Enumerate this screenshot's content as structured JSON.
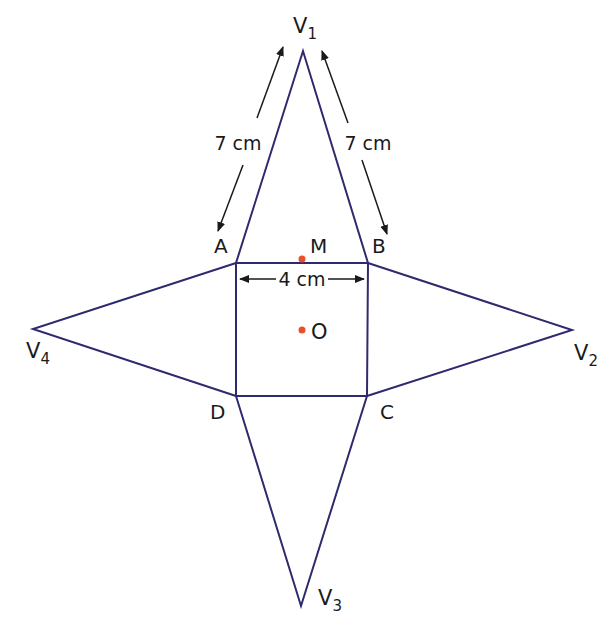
{
  "figure": {
    "type": "net of square-based pyramid",
    "colors": {
      "edge": "#2e2a6e",
      "arrow": "#1a1a1a",
      "point": "#e8502a",
      "text": "#1a1a1a"
    },
    "vertices": {
      "A": {
        "label": "A",
        "x": 236,
        "y": 263
      },
      "B": {
        "label": "B",
        "x": 368,
        "y": 263
      },
      "C": {
        "label": "C",
        "x": 367,
        "y": 396
      },
      "D": {
        "label": "D",
        "x": 236,
        "y": 396
      },
      "V1": {
        "label": "V",
        "sub": "1",
        "x": 303,
        "y": 51
      },
      "V2": {
        "label": "V",
        "sub": "2",
        "x": 572,
        "y": 330
      },
      "V3": {
        "label": "V",
        "sub": "3",
        "x": 301,
        "y": 606
      },
      "V4": {
        "label": "V",
        "sub": "4",
        "x": 33,
        "y": 329
      }
    },
    "points": {
      "M": {
        "label": "M",
        "x": 302,
        "y": 259
      },
      "O": {
        "label": "O",
        "x": 302,
        "y": 330
      }
    },
    "dimensions": {
      "slant_left": "7 cm",
      "slant_right": "7 cm",
      "base_side": "4 cm"
    }
  }
}
